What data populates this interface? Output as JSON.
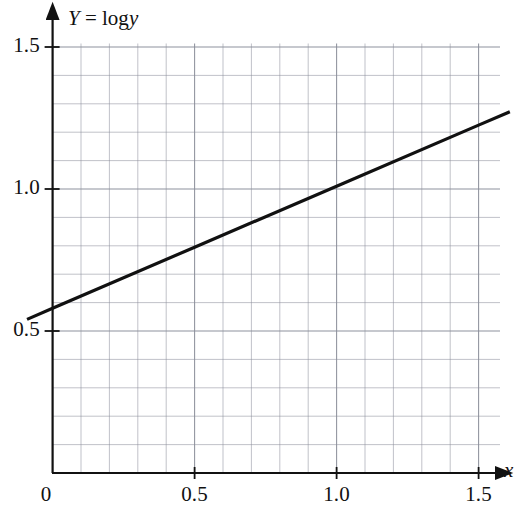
{
  "chart_data": {
    "type": "line",
    "title": "",
    "subtitle": "",
    "xlabel": "x",
    "ylabel": "Y = log y",
    "ylabel_parts": {
      "symbol": "Y",
      "equals": "=",
      "function": "log",
      "argument": "y"
    },
    "xlim": [
      0,
      1.5
    ],
    "ylim": [
      0,
      1.5
    ],
    "x_ticks": [
      {
        "value": 0,
        "label": "0"
      },
      {
        "value": 0.5,
        "label": "0.5"
      },
      {
        "value": 1.0,
        "label": "1.0"
      },
      {
        "value": 1.5,
        "label": "1.5"
      }
    ],
    "y_ticks": [
      {
        "value": 0.5,
        "label": "0.5"
      },
      {
        "value": 1.0,
        "label": "1.0"
      },
      {
        "value": 1.5,
        "label": "1.5"
      }
    ],
    "grid": true,
    "grid_step": 0.1,
    "grid_color": "#8a8d99",
    "legend": null,
    "series": [
      {
        "name": "Y = log y regression line",
        "type": "line",
        "color": "#111111",
        "intercept": 0.58,
        "slope": 0.43,
        "x": [
          -0.09,
          0.0,
          0.5,
          1.0,
          1.5,
          1.61
        ],
        "y": [
          0.541,
          0.58,
          0.795,
          1.01,
          1.225,
          1.272
        ],
        "endpoints": {
          "x_start": -0.09,
          "y_start": 0.541,
          "x_end": 1.61,
          "y_end": 1.272
        }
      }
    ],
    "annotations": []
  },
  "axes": {
    "x_arrow": true,
    "y_arrow": true,
    "axis_color": "#111111"
  }
}
